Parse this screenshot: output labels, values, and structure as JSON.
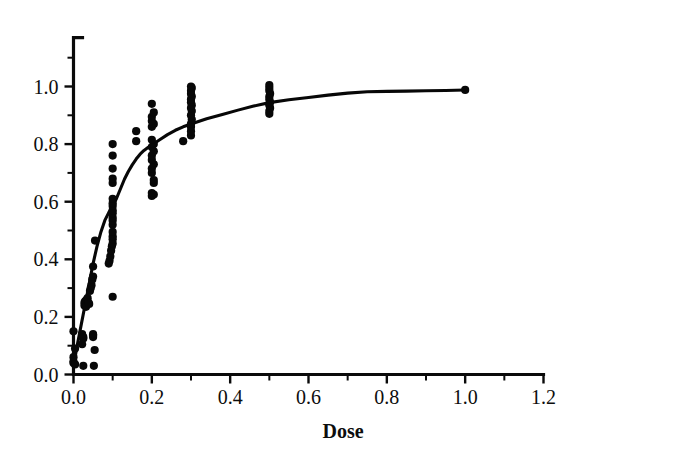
{
  "chart_data": {
    "type": "scatter",
    "title": "",
    "subtitle": "",
    "xlabel": "Dose",
    "ylabel": "",
    "xlim": [
      0.0,
      1.2
    ],
    "ylim": [
      0.0,
      1.15
    ],
    "grid": false,
    "legend": null,
    "legend_position": "none",
    "x_ticks": [
      0.0,
      0.2,
      0.4,
      0.6,
      0.8,
      1.0,
      1.2
    ],
    "x_tick_labels": [
      "0.0",
      "0.2",
      "0.4",
      "0.6",
      "0.8",
      "1.0",
      "1.2"
    ],
    "x_minor_ticks": [
      0.1,
      0.3,
      0.5,
      0.7,
      0.9,
      1.1
    ],
    "y_ticks": [
      0.0,
      0.2,
      0.4,
      0.6,
      0.8,
      1.0
    ],
    "y_tick_labels": [
      "0.0",
      "0.2",
      "0.4",
      "0.6",
      "0.8",
      "1.0"
    ],
    "y_minor_ticks": [
      0.1,
      0.3,
      0.5,
      0.7,
      0.9,
      1.1
    ],
    "marker": "filled-circle",
    "marker_size": 4.1,
    "color": "#080808",
    "curve_color": "#070707",
    "background": "#ffffff",
    "series": [
      {
        "name": "observations",
        "type": "scatter",
        "points": [
          [
            0.0,
            0.04
          ],
          [
            0.0,
            0.045
          ],
          [
            0.0,
            0.15
          ],
          [
            0.0,
            0.06
          ],
          [
            0.004,
            0.035
          ],
          [
            0.004,
            0.09
          ],
          [
            0.022,
            0.105
          ],
          [
            0.022,
            0.135
          ],
          [
            0.022,
            0.14
          ],
          [
            0.025,
            0.03
          ],
          [
            0.025,
            0.125
          ],
          [
            0.025,
            0.13
          ],
          [
            0.028,
            0.24
          ],
          [
            0.028,
            0.25
          ],
          [
            0.03,
            0.255
          ],
          [
            0.032,
            0.235
          ],
          [
            0.034,
            0.26
          ],
          [
            0.036,
            0.265
          ],
          [
            0.038,
            0.25
          ],
          [
            0.04,
            0.245
          ],
          [
            0.042,
            0.29
          ],
          [
            0.044,
            0.3
          ],
          [
            0.046,
            0.31
          ],
          [
            0.048,
            0.33
          ],
          [
            0.05,
            0.34
          ],
          [
            0.05,
            0.375
          ],
          [
            0.05,
            0.13
          ],
          [
            0.05,
            0.135
          ],
          [
            0.05,
            0.14
          ],
          [
            0.052,
            0.03
          ],
          [
            0.054,
            0.085
          ],
          [
            0.055,
            0.465
          ],
          [
            0.09,
            0.385
          ],
          [
            0.092,
            0.395
          ],
          [
            0.094,
            0.41
          ],
          [
            0.096,
            0.43
          ],
          [
            0.098,
            0.445
          ],
          [
            0.1,
            0.455
          ],
          [
            0.1,
            0.47
          ],
          [
            0.1,
            0.48
          ],
          [
            0.1,
            0.495
          ],
          [
            0.1,
            0.52
          ],
          [
            0.1,
            0.535
          ],
          [
            0.1,
            0.545
          ],
          [
            0.1,
            0.56
          ],
          [
            0.1,
            0.57
          ],
          [
            0.1,
            0.585
          ],
          [
            0.1,
            0.595
          ],
          [
            0.1,
            0.61
          ],
          [
            0.1,
            0.665
          ],
          [
            0.1,
            0.68
          ],
          [
            0.1,
            0.715
          ],
          [
            0.1,
            0.76
          ],
          [
            0.1,
            0.8
          ],
          [
            0.1,
            0.27
          ],
          [
            0.16,
            0.81
          ],
          [
            0.16,
            0.845
          ],
          [
            0.2,
            0.62
          ],
          [
            0.2,
            0.63
          ],
          [
            0.205,
            0.625
          ],
          [
            0.205,
            0.665
          ],
          [
            0.205,
            0.675
          ],
          [
            0.2,
            0.7
          ],
          [
            0.2,
            0.715
          ],
          [
            0.205,
            0.73
          ],
          [
            0.2,
            0.745
          ],
          [
            0.2,
            0.76
          ],
          [
            0.205,
            0.775
          ],
          [
            0.2,
            0.79
          ],
          [
            0.205,
            0.8
          ],
          [
            0.2,
            0.815
          ],
          [
            0.2,
            0.86
          ],
          [
            0.205,
            0.87
          ],
          [
            0.2,
            0.88
          ],
          [
            0.2,
            0.895
          ],
          [
            0.205,
            0.91
          ],
          [
            0.2,
            0.94
          ],
          [
            0.28,
            0.81
          ],
          [
            0.3,
            0.83
          ],
          [
            0.3,
            0.845
          ],
          [
            0.3,
            0.86
          ],
          [
            0.3,
            0.87
          ],
          [
            0.302,
            0.885
          ],
          [
            0.3,
            0.9
          ],
          [
            0.302,
            0.915
          ],
          [
            0.3,
            0.925
          ],
          [
            0.302,
            0.935
          ],
          [
            0.3,
            0.945
          ],
          [
            0.3,
            0.955
          ],
          [
            0.302,
            0.965
          ],
          [
            0.3,
            0.975
          ],
          [
            0.3,
            0.985
          ],
          [
            0.302,
            0.995
          ],
          [
            0.3,
            1.0
          ],
          [
            0.5,
            0.905
          ],
          [
            0.5,
            0.915
          ],
          [
            0.502,
            0.925
          ],
          [
            0.5,
            0.935
          ],
          [
            0.502,
            0.945
          ],
          [
            0.5,
            0.955
          ],
          [
            0.5,
            0.965
          ],
          [
            0.502,
            0.975
          ],
          [
            0.5,
            0.985
          ],
          [
            0.5,
            0.995
          ],
          [
            0.5,
            1.005
          ],
          [
            1.0,
            0.988
          ]
        ]
      },
      {
        "name": "fitted-curve",
        "type": "line",
        "description": "saturating dose-response fit",
        "points": [
          [
            0.0,
            0.03
          ],
          [
            0.01,
            0.105
          ],
          [
            0.02,
            0.175
          ],
          [
            0.03,
            0.245
          ],
          [
            0.04,
            0.315
          ],
          [
            0.05,
            0.385
          ],
          [
            0.06,
            0.445
          ],
          [
            0.07,
            0.495
          ],
          [
            0.08,
            0.535
          ],
          [
            0.09,
            0.562
          ],
          [
            0.1,
            0.585
          ],
          [
            0.11,
            0.612
          ],
          [
            0.12,
            0.645
          ],
          [
            0.13,
            0.678
          ],
          [
            0.14,
            0.705
          ],
          [
            0.15,
            0.728
          ],
          [
            0.16,
            0.748
          ],
          [
            0.17,
            0.765
          ],
          [
            0.18,
            0.778
          ],
          [
            0.19,
            0.788
          ],
          [
            0.2,
            0.797
          ],
          [
            0.22,
            0.815
          ],
          [
            0.24,
            0.833
          ],
          [
            0.26,
            0.848
          ],
          [
            0.28,
            0.86
          ],
          [
            0.3,
            0.87
          ],
          [
            0.34,
            0.888
          ],
          [
            0.38,
            0.903
          ],
          [
            0.42,
            0.918
          ],
          [
            0.46,
            0.932
          ],
          [
            0.5,
            0.944
          ],
          [
            0.55,
            0.954
          ],
          [
            0.6,
            0.962
          ],
          [
            0.65,
            0.97
          ],
          [
            0.7,
            0.977
          ],
          [
            0.75,
            0.982
          ],
          [
            0.8,
            0.983
          ],
          [
            0.85,
            0.984
          ],
          [
            0.9,
            0.985
          ],
          [
            0.95,
            0.986
          ],
          [
            1.0,
            0.988
          ]
        ]
      }
    ]
  },
  "figure": {
    "axis_title_x": "Dose",
    "caption": ""
  }
}
